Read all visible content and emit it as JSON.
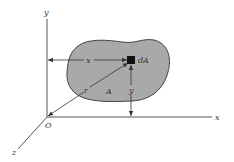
{
  "diagram": {
    "title": "",
    "labels": {
      "y_axis": "y",
      "x_axis": "x",
      "z_axis": "z",
      "origin": "O",
      "element": "dA",
      "area": "A",
      "x_distance": "x",
      "y_distance": "y",
      "radius": "r"
    },
    "colors": {
      "region_fill": "#a9a9a9",
      "stroke": "#333333",
      "element": "#111111",
      "background": "#ffffff"
    }
  }
}
